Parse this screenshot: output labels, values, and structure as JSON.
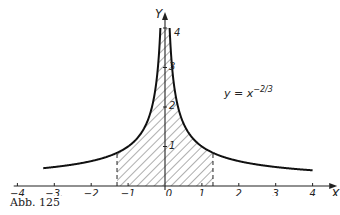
{
  "caption": "Abb. 125",
  "chart_data": {
    "type": "line",
    "title": "",
    "function_label": "y = x^(-2/3)",
    "function_label_base": "y = x",
    "function_label_exponent": "−2/3",
    "xlabel": "X",
    "ylabel": "Y",
    "xlim": [
      -4,
      4
    ],
    "ylim": [
      0,
      4
    ],
    "x_ticks": [
      -4,
      -3,
      -2,
      -1,
      0,
      1,
      2,
      3,
      4
    ],
    "x_tick_labels": [
      "−4",
      "−3.",
      "−2",
      "−1",
      "0",
      "1",
      "2",
      "3",
      "4"
    ],
    "y_ticks": [
      1,
      2,
      3,
      4
    ],
    "y_tick_labels": [
      "1",
      "2",
      "3",
      "4"
    ],
    "grid": false,
    "legend": "none",
    "series": [
      {
        "name": "y = x^(-2/3)",
        "x_range": [
          -4,
          4
        ],
        "formula": "|x|^(-2/3)",
        "clip_y": 4
      }
    ],
    "shaded_region": {
      "x_from": -1.3,
      "x_to": 1.3,
      "y_cap": 4,
      "pattern": "hatched",
      "boundary": "dashed"
    }
  }
}
